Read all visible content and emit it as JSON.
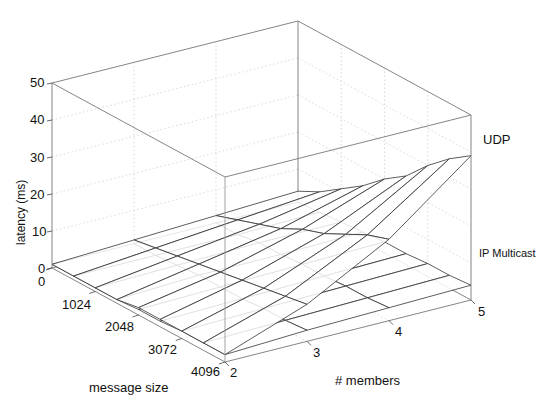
{
  "chart_data": {
    "type": "surface3d",
    "title": "",
    "xlabel": "message size",
    "ylabel": "# members",
    "zlabel": "latency (ms)",
    "x_ticks": [
      "0",
      "1024",
      "2048",
      "3072",
      "4096"
    ],
    "y_ticks": [
      "2",
      "3",
      "4",
      "5"
    ],
    "z_ticks": [
      "0",
      "10",
      "20",
      "30",
      "40",
      "50"
    ],
    "zlim": [
      0,
      50
    ],
    "grid": true,
    "x": [
      0,
      512,
      1024,
      1536,
      2048,
      2560,
      3072,
      3584,
      4096
    ],
    "y": [
      2,
      3,
      4,
      5
    ],
    "series": [
      {
        "name": "UDP",
        "z": [
          [
            1,
            2,
            3,
            4
          ],
          [
            1,
            3,
            5,
            7
          ],
          [
            1,
            4,
            7,
            11
          ],
          [
            1,
            5,
            9,
            15
          ],
          [
            2,
            6,
            12,
            20
          ],
          [
            2,
            7,
            14,
            24
          ],
          [
            2,
            8,
            17,
            30
          ],
          [
            2,
            9,
            20,
            35
          ],
          [
            2,
            10,
            22,
            39
          ]
        ]
      },
      {
        "name": "IP Multicast",
        "z": [
          [
            1,
            1,
            1,
            1
          ],
          [
            1,
            1,
            1,
            1.5
          ],
          [
            1,
            1.5,
            2,
            2
          ],
          [
            1,
            2,
            2,
            2.5
          ],
          [
            1.5,
            2,
            2.5,
            3
          ],
          [
            1.5,
            2,
            2.5,
            3
          ],
          [
            2,
            2.5,
            3,
            3.5
          ],
          [
            2,
            2.5,
            3,
            3.5
          ],
          [
            2,
            3,
            3.5,
            4
          ]
        ]
      }
    ],
    "annotations": [
      "UDP",
      "IP Multicast"
    ]
  },
  "labels": {
    "zlabel": "latency (ms)",
    "xlabel": "message size",
    "ylabel": "# members",
    "z_ticks": [
      "50",
      "40",
      "30",
      "20",
      "10",
      "0"
    ],
    "x_ticks": [
      "0",
      "1024",
      "2048",
      "3072",
      "4096"
    ],
    "y_ticks": [
      "2",
      "3",
      "4",
      "5"
    ],
    "series_udp": "UDP",
    "series_ipm": "IP Multicast"
  }
}
